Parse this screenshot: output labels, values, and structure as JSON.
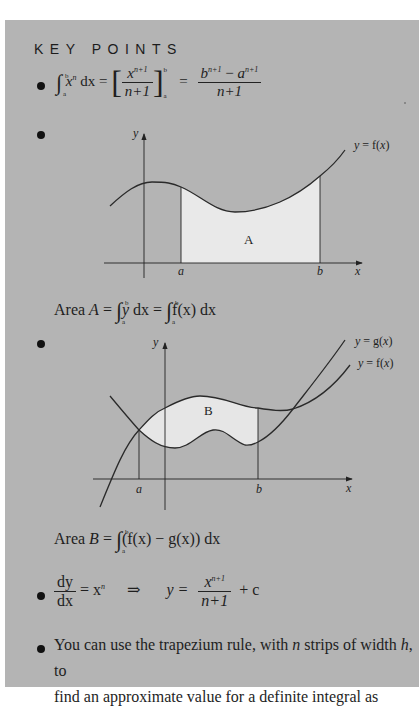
{
  "heading": "KEY POINTS",
  "point1": {
    "lhs_integrand": "x",
    "lhs_power": "n",
    "lhs_lower": "a",
    "lhs_upper": "b",
    "dx": "dx",
    "eq1": "=",
    "bracket_num": "x",
    "bracket_num_power": "n+1",
    "bracket_den": "n+1",
    "bracket_lower": "a",
    "bracket_upper": "b",
    "eq2": "=",
    "rhs_num_b": "b",
    "rhs_num_b_power": "n+1",
    "rhs_minus": " − ",
    "rhs_num_a": "a",
    "rhs_num_a_power": "n+1",
    "rhs_den": "n+1"
  },
  "diagram1": {
    "y_axis_label": "y",
    "x_axis_label": "x",
    "curve_label": "y = f(x)",
    "region_label": "A",
    "a_label": "a",
    "b_label": "b",
    "region_color": "#e9e9e9",
    "line_color": "#2a2a2a"
  },
  "area_a": {
    "prefix": "Area ",
    "var": "A",
    "eq": " = ",
    "int1_upper": "b",
    "int1_lower": "a",
    "int1_body": "y",
    "int1_dx": " dx = ",
    "int2_upper": "b",
    "int2_lower": "a",
    "int2_body": "f(x) dx"
  },
  "diagram2": {
    "y_axis_label": "y",
    "x_axis_label": "x",
    "curve_g_label": "y = g(x)",
    "curve_f_label": "y = f(x)",
    "region_label": "B",
    "a_label": "a",
    "b_label": "b",
    "region_color": "#e6e6e6"
  },
  "area_b": {
    "prefix": "Area ",
    "var": "B",
    "eq": " = ",
    "int_upper": "b",
    "int_lower": "a",
    "body": "(f(x) − g(x)) dx"
  },
  "point4": {
    "dy": "dy",
    "dx": "dx",
    "eq": "= x",
    "power": "n",
    "implies": "⇒",
    "y_eq": "y =",
    "num": "x",
    "num_power": "n+1",
    "den": "n+1",
    "plus_c": "+ c"
  },
  "point5": {
    "line1_a": "You can use the trapezium rule, with ",
    "line1_n": "n",
    "line1_b": " strips of width ",
    "line1_h": "h",
    "line1_c": ", to",
    "line2": "find an approximate value for a definite integral as"
  }
}
